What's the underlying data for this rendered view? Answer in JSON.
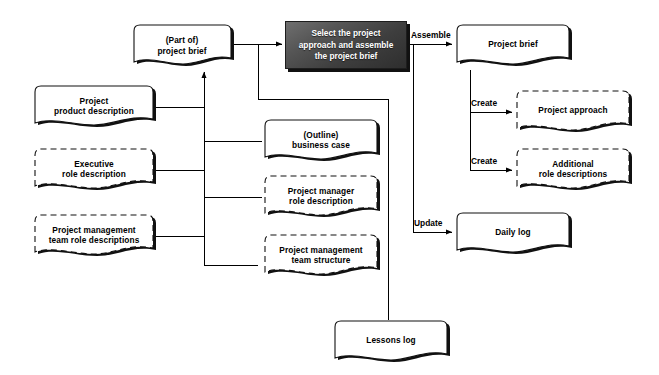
{
  "diagram": {
    "title": "Select the project approach and assemble the project brief",
    "type": "prince2-process-flow",
    "background": "#ffffff",
    "process_fill_dark": "#3e3e3e",
    "process_text_color": "#ffffff",
    "line_color": "#000000",
    "shadow_color": "#111111"
  },
  "nodes": {
    "part_of_project_brief": {
      "label_line1": "(Part of)",
      "label_line2": "project brief",
      "style": "solid",
      "kind": "document"
    },
    "project_product_description": {
      "label_line1": "Project",
      "label_line2": "product description",
      "style": "solid",
      "kind": "document"
    },
    "executive_role_description": {
      "label_line1": "Executive",
      "label_line2": "role description",
      "style": "dashed",
      "kind": "document"
    },
    "pm_team_role_descriptions": {
      "label_line1": "Project management",
      "label_line2": "team role descriptions",
      "style": "dashed",
      "kind": "document"
    },
    "outline_business_case": {
      "label_line1": "(Outline)",
      "label_line2": "business case",
      "style": "solid",
      "kind": "document"
    },
    "project_manager_role_description": {
      "label_line1": "Project manager",
      "label_line2": "role description",
      "style": "dashed",
      "kind": "document"
    },
    "pm_team_structure": {
      "label_line1": "Project management",
      "label_line2": "team structure",
      "style": "dashed",
      "kind": "document"
    },
    "lessons_log": {
      "label_line1": "Lessons log",
      "label_line2": "",
      "style": "solid",
      "kind": "document"
    },
    "process_activity": {
      "label_line1": "Select the project",
      "label_line2": "approach and assemble",
      "label_line3": "the project brief",
      "style": "solid-dark",
      "kind": "process"
    },
    "project_brief": {
      "label_line1": "Project brief",
      "label_line2": "",
      "style": "solid",
      "kind": "document"
    },
    "project_approach": {
      "label_line1": "Project approach",
      "label_line2": "",
      "style": "dashed",
      "kind": "document"
    },
    "additional_role_descriptions": {
      "label_line1": "Additional",
      "label_line2": "role descriptions",
      "style": "dashed",
      "kind": "document"
    },
    "daily_log": {
      "label_line1": "Daily log",
      "label_line2": "",
      "style": "solid",
      "kind": "document"
    }
  },
  "edge_labels": {
    "assemble": "Assemble",
    "create_approach": "Create",
    "create_roles": "Create",
    "update": "Update"
  }
}
